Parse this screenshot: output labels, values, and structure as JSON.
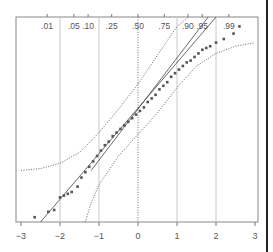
{
  "chart_data": {
    "type": "scatter",
    "title": "",
    "subtitle": "Normal probability plot with fitted line and confidence bands",
    "xlabel": "",
    "ylabel": "",
    "xlim": [
      -3,
      3
    ],
    "x_ticks": [
      "-3",
      "-2",
      "-1",
      "0",
      "1",
      "2",
      "3"
    ],
    "x_tick_values": [
      -3,
      -2,
      -1,
      0,
      1,
      2,
      3
    ],
    "top_axis_probability_labels": [
      ".01",
      ".05",
      ".10",
      ".25",
      ".50",
      ".75",
      ".90",
      ".95",
      ".99"
    ],
    "top_axis_probability_values": [
      0.01,
      0.05,
      0.1,
      0.25,
      0.5,
      0.75,
      0.9,
      0.95,
      0.99
    ],
    "grid": {
      "vertical": true,
      "horizontal": false,
      "at": [
        -2,
        -1,
        1,
        2
      ]
    },
    "reference_lines": [
      {
        "name": "zero-line",
        "x": 0,
        "style": "dotted"
      }
    ],
    "legend": null,
    "series": [
      {
        "name": "observed quantiles",
        "style": "points",
        "color": "#555555",
        "x": [
          -2.65,
          -2.3,
          -2.15,
          -2.0,
          -1.9,
          -1.8,
          -1.7,
          -1.55,
          -1.45,
          -1.35,
          -1.25,
          -1.15,
          -1.05,
          -0.95,
          -0.85,
          -0.75,
          -0.65,
          -0.55,
          -0.45,
          -0.35,
          -0.25,
          -0.15,
          -0.05,
          0.05,
          0.15,
          0.25,
          0.35,
          0.45,
          0.55,
          0.65,
          0.75,
          0.85,
          0.95,
          1.05,
          1.15,
          1.25,
          1.35,
          1.45,
          1.55,
          1.65,
          1.75,
          1.85,
          2.0,
          2.2,
          2.45,
          2.6
        ],
        "y": [
          -2.7,
          -2.55,
          -2.5,
          -2.15,
          -2.1,
          -2.05,
          -2.0,
          -1.85,
          -1.6,
          -1.45,
          -1.3,
          -1.15,
          -1.0,
          -0.85,
          -0.7,
          -0.6,
          -0.45,
          -0.35,
          -0.25,
          -0.15,
          -0.05,
          0.05,
          0.15,
          0.25,
          0.35,
          0.5,
          0.6,
          0.7,
          0.85,
          0.95,
          1.05,
          1.2,
          1.3,
          1.4,
          1.5,
          1.6,
          1.65,
          1.75,
          1.85,
          1.95,
          2.0,
          2.05,
          2.15,
          2.25,
          2.4,
          2.6
        ]
      },
      {
        "name": "fitted line",
        "style": "solid",
        "x": [
          -2.5,
          2.0
        ],
        "y": [
          -2.9,
          2.9
        ]
      },
      {
        "name": "fitted line 2",
        "style": "solid",
        "x": [
          -1.2,
          1.8
        ],
        "y": [
          -1.4,
          2.9
        ]
      },
      {
        "name": "upper band",
        "style": "dotted",
        "x": [
          -3.0,
          -2.5,
          -2.0,
          -1.5,
          -1.0,
          -0.5,
          0.0,
          0.5,
          1.0,
          1.3
        ],
        "y": [
          -1.4,
          -1.35,
          -1.2,
          -0.9,
          -0.35,
          0.3,
          1.0,
          1.8,
          2.6,
          3.0
        ]
      },
      {
        "name": "lower band",
        "style": "dotted",
        "x": [
          -1.35,
          -1.2,
          -1.0,
          -0.5,
          0.0,
          0.5,
          1.0,
          1.5,
          2.0,
          2.5,
          3.0
        ],
        "y": [
          -3.0,
          -2.3,
          -1.8,
          -1.0,
          -0.4,
          0.2,
          0.9,
          1.5,
          1.85,
          2.05,
          2.15
        ]
      }
    ]
  }
}
